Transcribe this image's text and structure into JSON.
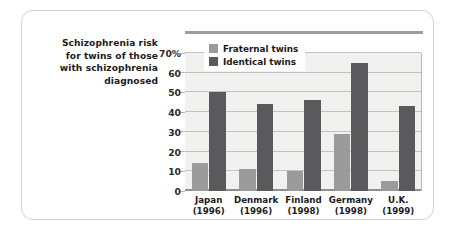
{
  "figure": {
    "caption_lines": [
      "Schizophrenia risk",
      "for twins of those",
      "with schizophrenia",
      "diagnosed"
    ]
  },
  "colors": {
    "fraternal": "#9b9b9b",
    "identical": "#5a5a5d",
    "plot_background": "#f1f1ef",
    "gridline": "#c2c2c0",
    "frame_border": "#d2d2d2",
    "text": "#1b1b1b"
  },
  "chart_data": {
    "type": "bar",
    "title": "Schizophrenia risk for twins of those with schizophrenia diagnosed",
    "xlabel": "",
    "ylabel": "",
    "ylim": [
      0,
      70
    ],
    "yticks": [
      0,
      10,
      20,
      30,
      40,
      50,
      60,
      70
    ],
    "ytick_labels": [
      "0",
      "10",
      "20",
      "30",
      "40",
      "50",
      "60",
      "70%"
    ],
    "grid": true,
    "legend_position": "upper-left-inside",
    "categories": [
      "Japan",
      "Denmark",
      "Finland",
      "Germany",
      "U.K."
    ],
    "category_years": [
      "(1996)",
      "(1996)",
      "(1998)",
      "(1998)",
      "(1999)"
    ],
    "series": [
      {
        "name": "Fraternal twins",
        "color": "#9b9b9b",
        "values": [
          14,
          11,
          10,
          29,
          5
        ]
      },
      {
        "name": "Identical twins",
        "color": "#5a5a5d",
        "values": [
          50,
          44,
          46,
          65,
          43
        ]
      }
    ]
  }
}
